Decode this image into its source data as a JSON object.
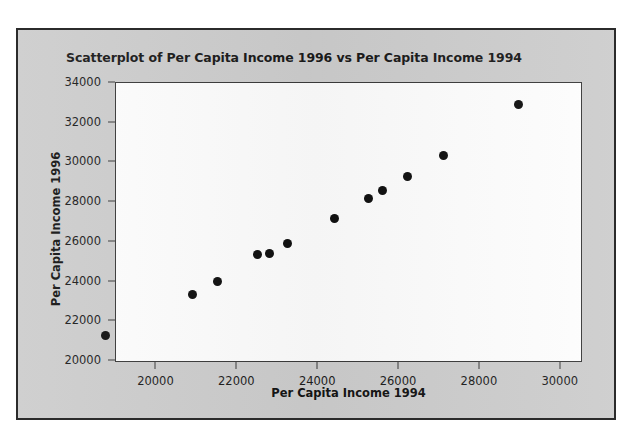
{
  "chart_data": {
    "type": "scatter",
    "title": "Scatterplot of Per Capita Income 1996 vs Per Capita Income 1994",
    "xlabel": "Per Capita Income 1994",
    "ylabel": "Per Capita Income 1996",
    "xlim": [
      19000,
      30500
    ],
    "ylim": [
      20000,
      34000
    ],
    "xticks": [
      20000,
      22000,
      24000,
      26000,
      28000,
      30000
    ],
    "yticks": [
      20000,
      22000,
      24000,
      26000,
      28000,
      30000,
      32000,
      34000
    ],
    "xtick_labels": [
      "20000",
      "22000",
      "24000",
      "26000",
      "28000",
      "30000"
    ],
    "ytick_labels": [
      "20000",
      "22000",
      "24000",
      "26000",
      "28000",
      "30000",
      "32000",
      "34000"
    ],
    "grid": false,
    "legend": null,
    "marker": "filled-circle",
    "marker_color": "#101010",
    "n_points": 13,
    "points": [
      {
        "x": 18750,
        "y": 21300
      },
      {
        "x": 20900,
        "y": 23350
      },
      {
        "x": 21500,
        "y": 24000
      },
      {
        "x": 22500,
        "y": 25350
      },
      {
        "x": 22800,
        "y": 25400
      },
      {
        "x": 23250,
        "y": 25900
      },
      {
        "x": 24400,
        "y": 27200
      },
      {
        "x": 25250,
        "y": 28200
      },
      {
        "x": 25600,
        "y": 28600
      },
      {
        "x": 26200,
        "y": 29300
      },
      {
        "x": 27100,
        "y": 30350
      },
      {
        "x": 28950,
        "y": 32900
      }
    ],
    "colors": {
      "figure_background": "#cdcdcd",
      "plot_background": "#fdfdfd",
      "frame": "#2b2b2b",
      "axis": "#3a3a3a",
      "text": "#1a1a1a"
    }
  }
}
